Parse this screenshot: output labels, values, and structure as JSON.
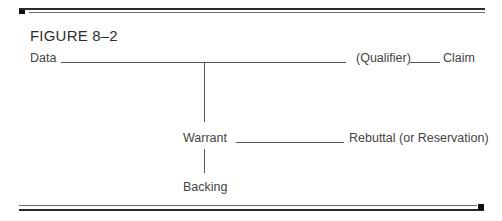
{
  "figure": {
    "title": "FIGURE 8–2"
  },
  "diagram": {
    "type": "Toulmin argument model",
    "nodes": {
      "data": "Data",
      "qualifier": "(Qualifier)",
      "claim": "Claim",
      "warrant": "Warrant",
      "rebuttal": "Rebuttal (or Reservation)",
      "backing": "Backing"
    },
    "edges": [
      {
        "from": "data",
        "to": "qualifier"
      },
      {
        "from": "qualifier",
        "to": "claim"
      },
      {
        "from": "data-line",
        "to": "warrant"
      },
      {
        "from": "warrant",
        "to": "rebuttal"
      },
      {
        "from": "warrant",
        "to": "backing"
      }
    ]
  },
  "colors": {
    "rule": "#2a2a2a",
    "text": "#444444",
    "connector": "#555555"
  }
}
